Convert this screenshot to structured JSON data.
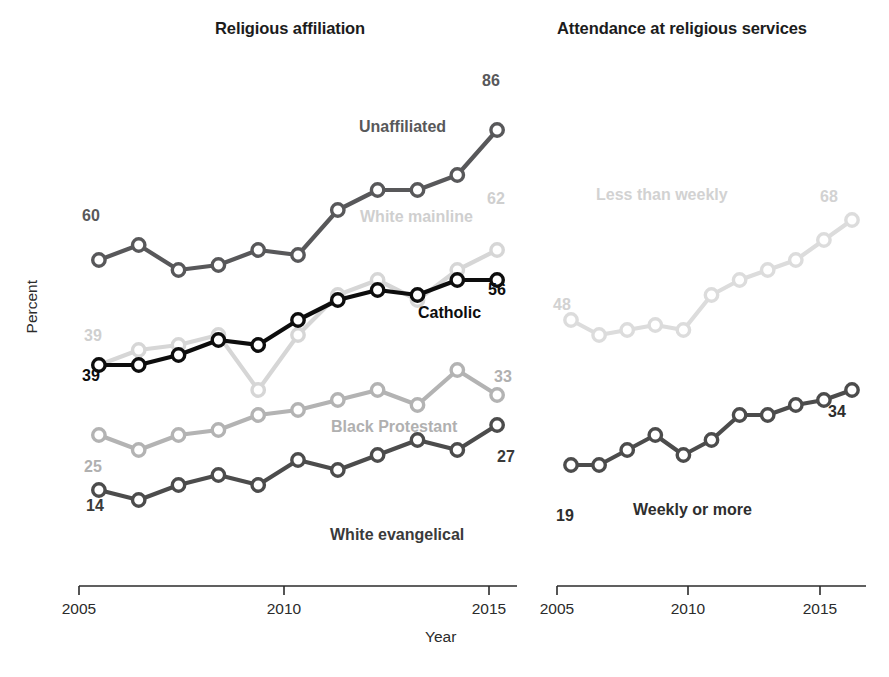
{
  "figure": {
    "xlabel": "Year",
    "ylabel": "Percent"
  },
  "panels": {
    "left": {
      "title": "Religious affiliation",
      "xticks": [
        "2005",
        "2010",
        "2015"
      ]
    },
    "right": {
      "title": "Attendance at religious services",
      "xticks": [
        "2005",
        "2010",
        "2015"
      ]
    }
  },
  "chart_data": [
    {
      "type": "line",
      "title": "Religious affiliation",
      "xlabel": "Year",
      "ylabel": "Percent",
      "xlim": [
        2005.0,
        2016.0
      ],
      "ylim": [
        0,
        100
      ],
      "xticks": [
        2005,
        2010,
        2015
      ],
      "grid": false,
      "legend": "inline-labels",
      "x": [
        2005.5,
        2006.5,
        2007.5,
        2008.5,
        2009.5,
        2010.5,
        2011.5,
        2012.5,
        2013.5,
        2014.5,
        2015.5
      ],
      "series": [
        {
          "name": "Unaffiliated",
          "color": "#58585a",
          "start_label": "60",
          "end_label": "86",
          "values": [
            60,
            63,
            58,
            59,
            62,
            61,
            70,
            74,
            74,
            77,
            86
          ]
        },
        {
          "name": "White mainline",
          "color": "#d6d6d6",
          "start_label": "39",
          "end_label": "62",
          "values": [
            39,
            42,
            43,
            45,
            34,
            45,
            53,
            56,
            52,
            58,
            62
          ]
        },
        {
          "name": "Catholic",
          "color": "#0d0d0d",
          "start_label": "39",
          "end_label": "56",
          "values": [
            39,
            39,
            41,
            44,
            43,
            48,
            52,
            54,
            53,
            56,
            56
          ]
        },
        {
          "name": "Black Protestant",
          "color": "#b3b3b3",
          "start_label": "25",
          "end_label": "33",
          "values": [
            25,
            22,
            25,
            26,
            29,
            30,
            32,
            34,
            31,
            38,
            33
          ]
        },
        {
          "name": "White evangelical",
          "color": "#4c4c4c",
          "start_label": "14",
          "end_label": "27",
          "values": [
            14,
            12,
            15,
            17,
            15,
            20,
            18,
            21,
            24,
            22,
            27
          ]
        }
      ]
    },
    {
      "type": "line",
      "title": "Attendance at religious services",
      "xlabel": "Year",
      "ylabel": "Percent",
      "xlim": [
        2005.0,
        2016.0
      ],
      "ylim": [
        0,
        100
      ],
      "xticks": [
        2005,
        2010,
        2015
      ],
      "grid": false,
      "legend": "inline-labels",
      "x": [
        2005.5,
        2006.5,
        2007.5,
        2008.5,
        2009.5,
        2010.5,
        2011.5,
        2012.5,
        2013.5,
        2014.5,
        2015.5
      ],
      "series": [
        {
          "name": "Less than weekly",
          "color": "#dcdcdc",
          "start_label": "48",
          "end_label": "68",
          "values": [
            48,
            45,
            46,
            47,
            46,
            53,
            56,
            58,
            60,
            64,
            68
          ]
        },
        {
          "name": "Weekly or more",
          "color": "#4c4c4c",
          "start_label": "19",
          "end_label": "34",
          "values": [
            19,
            19,
            22,
            25,
            21,
            24,
            29,
            29,
            31,
            32,
            34
          ]
        }
      ]
    }
  ]
}
